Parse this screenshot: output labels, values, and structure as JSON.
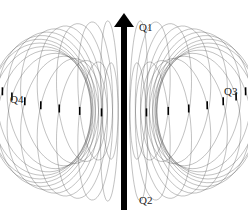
{
  "diagram": {
    "type": "toroidal-field",
    "labels": {
      "q1": "Q1",
      "q2": "Q2",
      "q3": "Q3",
      "q4": "Q4"
    },
    "colors": {
      "arrow": "#000000",
      "loops": "#555555",
      "background": "#ffffff"
    },
    "torus": {
      "cx": 124,
      "cy": 111,
      "rx": 88,
      "ry": 70,
      "loop_count": 36
    }
  }
}
